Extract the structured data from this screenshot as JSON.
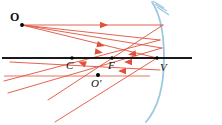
{
  "figure": {
    "type": "optics-ray-diagram",
    "width": 222,
    "height": 125,
    "background": "#ffffff"
  },
  "colors": {
    "ray": "#e0503c",
    "ray_faded": "#eaa795",
    "mirror": "#9ec8e0",
    "axis": "#1a1a1a",
    "label": "#111111",
    "point": "#000000"
  },
  "labels": [
    {
      "id": "object-point",
      "text": "O",
      "x": 10,
      "y": 11,
      "style": "bold",
      "size": 12
    },
    {
      "id": "center-of-curvature",
      "text": "C",
      "x": 66,
      "y": 60,
      "style": "italic",
      "size": 11
    },
    {
      "id": "focal-point",
      "text": "F",
      "x": 108,
      "y": 60,
      "style": "italic",
      "size": 11
    },
    {
      "id": "vertex-point",
      "text": "V",
      "x": 160,
      "y": 62,
      "style": "italic",
      "size": 11
    },
    {
      "id": "image-point",
      "text": "O′",
      "x": 91,
      "y": 78,
      "style": "italic",
      "size": 11
    }
  ],
  "points": [
    {
      "id": "O",
      "cx": 22,
      "cy": 25,
      "r": 1.9
    },
    {
      "id": "C",
      "cx": 72,
      "cy": 58,
      "r": 1.7
    },
    {
      "id": "F",
      "cx": 112,
      "cy": 58,
      "r": 1.7
    },
    {
      "id": "V",
      "cx": 157,
      "cy": 58,
      "r": 1.7
    },
    {
      "id": "Oprime",
      "cx": 98,
      "cy": 75,
      "r": 2.0
    }
  ],
  "principal_axis": {
    "x1": 2,
    "y1": 58,
    "x2": 192,
    "y2": 58,
    "width": 2.2
  },
  "mirror": {
    "path": "M 152 2 C 160 14 164 34 164 58 C 164 86 158 108 146 122",
    "width": 1.8,
    "hatching": [
      {
        "x1": 153,
        "y1": 1,
        "x2": 164,
        "y2": 8
      },
      {
        "x1": 155,
        "y1": 4,
        "x2": 167,
        "y2": 11
      },
      {
        "x1": 157,
        "y1": 7,
        "x2": 169,
        "y2": 15
      }
    ]
  },
  "faded_line": {
    "x1": 4,
    "y1": 76,
    "x2": 150,
    "y2": 76,
    "width": 1.6
  },
  "rays": [
    {
      "id": "incident-parallel",
      "x1": 22,
      "y1": 25,
      "x2": 163,
      "y2": 25
    },
    {
      "id": "incident-to-vertex",
      "x1": 22,
      "y1": 25,
      "x2": 157,
      "y2": 58
    },
    {
      "id": "incident-through-C",
      "x1": 22,
      "y1": 25,
      "x2": 162,
      "y2": 48
    },
    {
      "id": "incident-through-F",
      "x1": 22,
      "y1": 25,
      "x2": 160,
      "y2": 40
    },
    {
      "id": "reflected-parallel-through-F",
      "x1": 163,
      "y1": 25,
      "x2": 48,
      "y2": 100
    },
    {
      "id": "reflected-at-vertex",
      "x1": 157,
      "y1": 58,
      "x2": 55,
      "y2": 122
    },
    {
      "id": "reflected-ray-c",
      "x1": 162,
      "y1": 48,
      "x2": 8,
      "y2": 93
    },
    {
      "id": "reflected-ray-f",
      "x1": 160,
      "y1": 40,
      "x2": 4,
      "y2": 81
    },
    {
      "id": "reflected-to-axis",
      "x1": 160,
      "y1": 70,
      "x2": 10,
      "y2": 62
    }
  ],
  "arrowheads": [
    {
      "id": "arrow-parallel-ray",
      "x": 104,
      "y": 25,
      "angle": 0
    },
    {
      "id": "arrow-incident-mid",
      "x": 101,
      "y": 45,
      "angle": 13
    },
    {
      "id": "arrow-incident-low",
      "x": 99,
      "y": 52,
      "angle": 9
    },
    {
      "id": "arrow-reflected-up",
      "x": 128,
      "y": 62,
      "angle": 180
    },
    {
      "id": "arrow-reflected-low",
      "x": 122,
      "y": 71,
      "angle": 180
    },
    {
      "id": "arrow-reflected-down",
      "x": 82,
      "y": 63,
      "angle": 200
    },
    {
      "id": "arrow-reflected-out",
      "x": 132,
      "y": 54,
      "angle": 170
    }
  ]
}
